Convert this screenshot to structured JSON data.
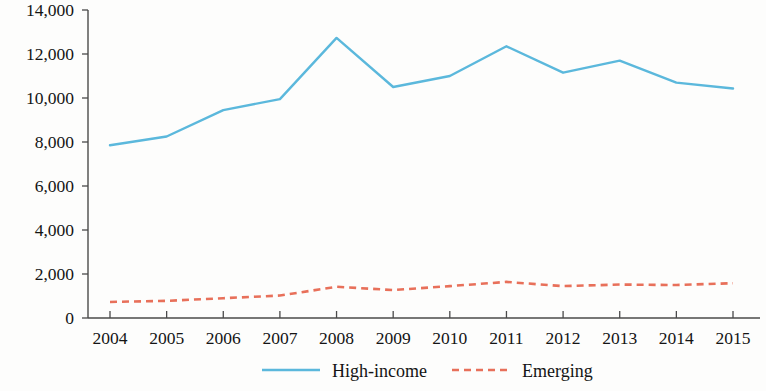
{
  "chart_data": {
    "type": "line",
    "title": "",
    "subtitle": "",
    "xlabel": "",
    "ylabel": "",
    "categories": [
      "2004",
      "2005",
      "2006",
      "2007",
      "2008",
      "2009",
      "2010",
      "2011",
      "2012",
      "2013",
      "2014",
      "2015"
    ],
    "x": [
      2004,
      2005,
      2006,
      2007,
      2008,
      2009,
      2010,
      2011,
      2012,
      2013,
      2014,
      2015
    ],
    "series": [
      {
        "name": "High-income",
        "values": [
          7850,
          8250,
          9450,
          9950,
          12730,
          10500,
          11000,
          12350,
          11150,
          11700,
          10700,
          10430
        ],
        "color": "#5BB8DC",
        "style": "solid"
      },
      {
        "name": "Emerging",
        "values": [
          730,
          780,
          900,
          1020,
          1420,
          1270,
          1450,
          1640,
          1450,
          1520,
          1500,
          1580
        ],
        "color": "#E8705A",
        "style": "dashed"
      }
    ],
    "ylim": [
      0,
      14000
    ],
    "yticks": [
      0,
      2000,
      4000,
      6000,
      8000,
      10000,
      12000,
      14000
    ],
    "ytick_labels": [
      "0",
      "2,000",
      "4,000",
      "6,000",
      "8,000",
      "10,000",
      "12,000",
      "14,000"
    ],
    "xtick_labels": [
      "2004",
      "2005",
      "2006",
      "2007",
      "2008",
      "2009",
      "2010",
      "2011",
      "2012",
      "2013",
      "2014",
      "2015"
    ],
    "grid": false,
    "legend_position": "bottom-center",
    "legend": [
      {
        "label": "High-income",
        "color": "#5BB8DC",
        "style": "solid"
      },
      {
        "label": "Emerging",
        "color": "#E8705A",
        "style": "dashed"
      }
    ]
  }
}
